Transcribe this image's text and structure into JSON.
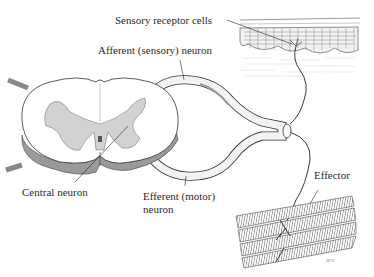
{
  "diagram": {
    "labels": {
      "sensory_receptor_cells": "Sensory receptor cells",
      "afferent_neuron": "Afferent (sensory) neuron",
      "central_neuron": "Central neuron",
      "efferent_neuron_line1": "Efferent (motor)",
      "efferent_neuron_line2": "neuron",
      "effector": "Effector"
    },
    "signature": "MFK",
    "colors": {
      "ink": "#2a2a2a",
      "gray_matter": "#cfcfcf",
      "shadow": "#8a8a8a",
      "background": "#ffffff"
    },
    "components": [
      "spinal-cord-cross-section",
      "afferent-nerve-root",
      "efferent-nerve-root",
      "nerve-trunk",
      "skin-tissue",
      "muscle-fibers"
    ]
  }
}
